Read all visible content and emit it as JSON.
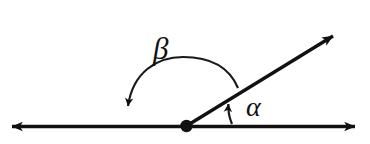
{
  "figure": {
    "kind": "geometry-diagram",
    "background_color": "#ffffff",
    "stroke_color": "#111111",
    "width": 370,
    "height": 144
  },
  "labels": {
    "beta": "β",
    "alpha": "α"
  },
  "elements": {
    "horizontal_line_name": "horizontal-line",
    "ray_name": "ray",
    "vertex_name": "vertex-point",
    "beta_arc_name": "beta-arc",
    "alpha_arc_name": "alpha-arc"
  },
  "geometry": {
    "vertex": {
      "x": 186,
      "y": 126
    },
    "horizontal_line": {
      "x1": 12,
      "y1": 126,
      "x2": 355,
      "y2": 126
    },
    "ray": {
      "x1": 186,
      "y1": 126,
      "x2": 333,
      "y2": 36
    },
    "beta_arc": {
      "start_x": 238,
      "start_y": 88,
      "end_x": 128,
      "end_y": 122,
      "peak_y": 64
    },
    "alpha_arc": {
      "start_x": 231,
      "start_y": 125,
      "end_x": 228,
      "end_y": 99
    },
    "alpha_label_position": {
      "x": 246,
      "y": 93
    },
    "beta_label_position": {
      "x": 153,
      "y": 33
    }
  }
}
